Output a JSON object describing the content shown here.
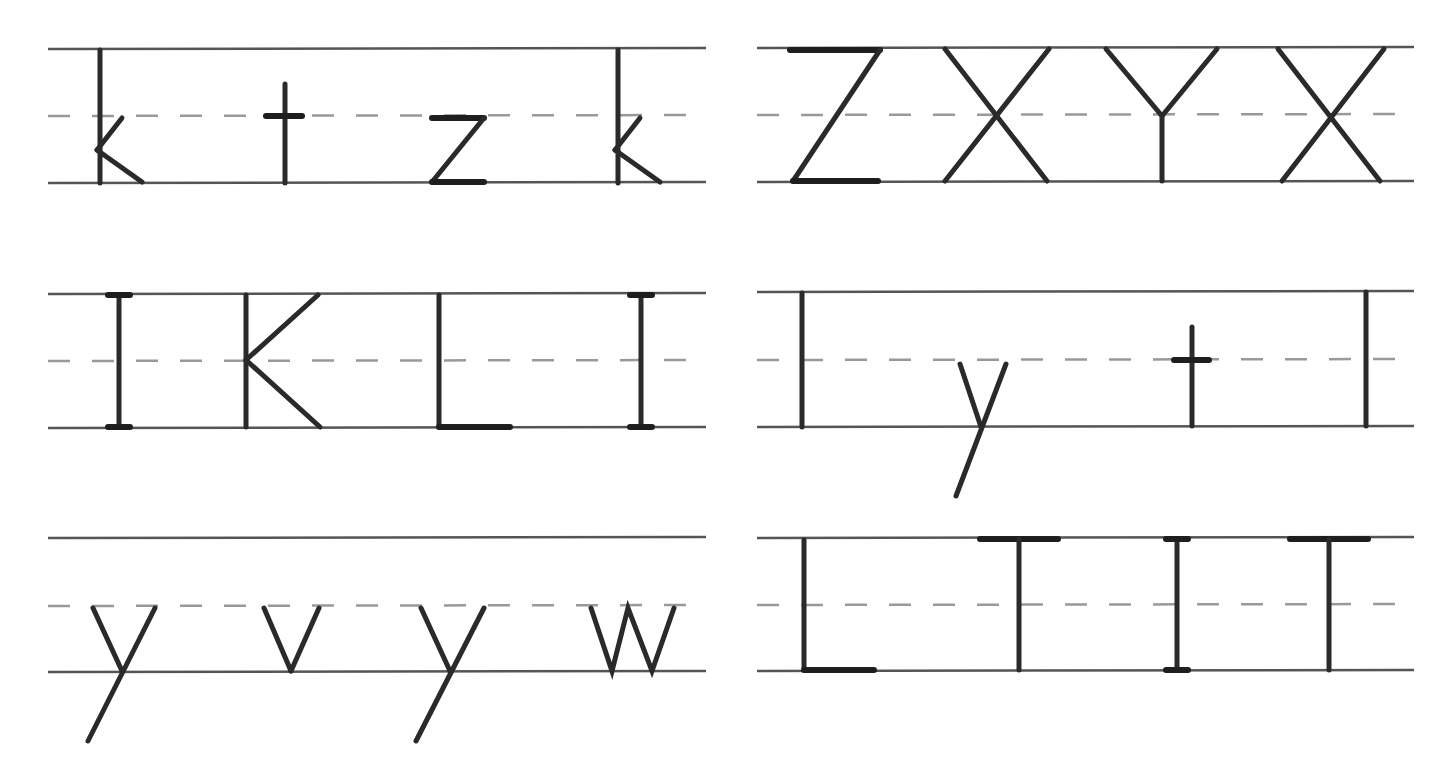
{
  "worksheet": {
    "type": "handwriting-practice",
    "line_colors": {
      "solid": "#555555",
      "dashed": "#999999",
      "ink": "#2a2a2a"
    },
    "panels": [
      {
        "id": "p1",
        "letters": [
          "k",
          "t",
          "z",
          "k"
        ]
      },
      {
        "id": "p2",
        "letters": [
          "Z",
          "X",
          "Y",
          "X"
        ]
      },
      {
        "id": "p3",
        "letters": [
          "I",
          "K",
          "L",
          "I"
        ]
      },
      {
        "id": "p4",
        "letters": [
          "l",
          "y",
          "t",
          "l"
        ]
      },
      {
        "id": "p5",
        "letters": [
          "y",
          "v",
          "y",
          "w"
        ]
      },
      {
        "id": "p6",
        "letters": [
          "L",
          "T",
          "I",
          "T"
        ]
      }
    ]
  }
}
